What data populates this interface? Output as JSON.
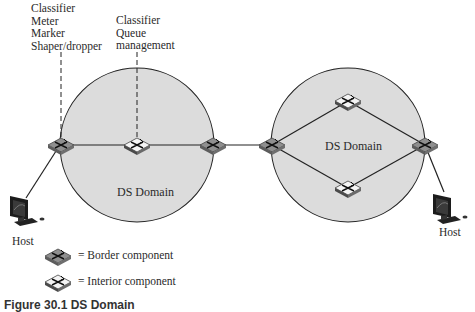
{
  "annotations": {
    "border_functions": [
      "Classifier",
      "Meter",
      "Marker",
      "Shaper/dropper"
    ],
    "interior_functions": [
      "Classifier",
      "Queue",
      "management"
    ]
  },
  "domains": [
    {
      "label": "DS Domain"
    },
    {
      "label": "DS Domain"
    }
  ],
  "hosts": [
    {
      "label": "Host"
    },
    {
      "label": "Host"
    }
  ],
  "legend": {
    "border": "= Border component",
    "interior": "= Interior component"
  },
  "caption": "Figure 30.1   DS Domain",
  "colors": {
    "domain_fill": "#dcdcdc",
    "line": "#222222",
    "border_router": "#8f8f8f",
    "interior_router": "#f4f4f4"
  }
}
